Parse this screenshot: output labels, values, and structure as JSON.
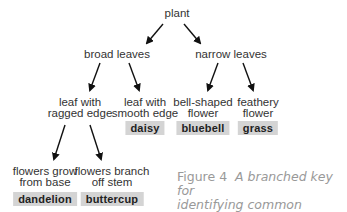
{
  "nodes": {
    "root": "plant",
    "broad": "broad leaves",
    "narrow": "narrow leaves",
    "ragged_l1": "leaf with",
    "ragged_l2": "ragged edge",
    "smooth_l1": "leaf with",
    "smooth_l2": "smooth edge",
    "bell_l1": "bell-shaped",
    "bell_l2": "flower",
    "feathery_l1": "feathery",
    "feathery_l2": "flower",
    "base_l1": "flowers grow",
    "base_l2": "from base",
    "branch_l1": "flowers branch",
    "branch_l2": "off stem"
  },
  "results": {
    "daisy": "daisy",
    "bluebell": "bluebell",
    "grass": "grass",
    "dandelion": "dandelion",
    "buttercup": "buttercup"
  },
  "caption": {
    "figure": "Figure 4",
    "text_l1": "A branched key for",
    "text_l2": "identifying common plants."
  },
  "colors": {
    "result_box": "#d4d4d4",
    "caption_text": "#999999",
    "arrow": "#111111"
  }
}
